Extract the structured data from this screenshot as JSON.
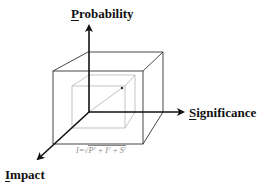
{
  "diagram": {
    "axes": {
      "probability": {
        "label_first": "P",
        "label_rest": "robability",
        "full_label": "Probability",
        "direction": "up"
      },
      "significance": {
        "label_first": "S",
        "label_rest": "ignificance",
        "full_label": "Significance",
        "direction": "right"
      },
      "impact": {
        "label_first": "I",
        "label_rest": "mpact",
        "full_label": "Impact",
        "direction": "down-left"
      }
    },
    "formula": {
      "lhs": "I=",
      "radical": "√",
      "terms": [
        "P",
        "I",
        "S"
      ],
      "exponent": "2",
      "plus": " + ",
      "full_text": "I=√(P² + I² + S²)"
    },
    "colors": {
      "axis": "#111111",
      "outer_cube": "#333333",
      "inner_cube": "#b0b0b0",
      "vector": "#b0b0b0",
      "point": "#333333",
      "formula": "#8a8a8a"
    }
  }
}
